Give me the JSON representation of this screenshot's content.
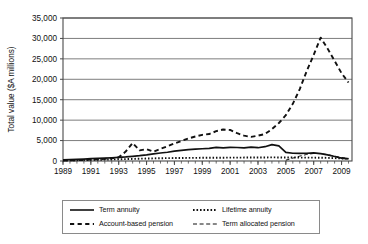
{
  "chart_data": {
    "type": "line",
    "title": "",
    "xlabel": "",
    "ylabel": "Total value ($A millions)",
    "xlim": [
      1989,
      2009.75
    ],
    "ylim": [
      0,
      35000
    ],
    "ytick_labels": [
      "0",
      "5,000",
      "10,000",
      "15,000",
      "20,000",
      "25,000",
      "30,000",
      "35,000"
    ],
    "ytick_values": [
      0,
      5000,
      10000,
      15000,
      20000,
      25000,
      30000,
      35000
    ],
    "xtick_labels": [
      "1989",
      "1991",
      "1993",
      "1995",
      "1997",
      "1999",
      "2001",
      "2003",
      "2005",
      "2007",
      "2009"
    ],
    "xtick_values": [
      1989,
      1991,
      1993,
      1995,
      1997,
      1999,
      2001,
      2003,
      2005,
      2007,
      2009
    ],
    "minor_xtick_interval": 0.5,
    "grid": "horizontal",
    "legend_position": "below",
    "x": [
      1989,
      1989.5,
      1990,
      1990.5,
      1991,
      1991.5,
      1992,
      1992.5,
      1993,
      1993.5,
      1994,
      1994.5,
      1995,
      1995.5,
      1996,
      1996.5,
      1997,
      1997.5,
      1998,
      1998.5,
      1999,
      1999.5,
      2000,
      2000.5,
      2001,
      2001.5,
      2002,
      2002.5,
      2003,
      2003.5,
      2004,
      2004.5,
      2005,
      2005.5,
      2006,
      2006.5,
      2007,
      2007.5,
      2008,
      2008.5,
      2009,
      2009.5
    ],
    "series": [
      {
        "name": "Term annuity",
        "style": "solid",
        "values": [
          300,
          350,
          420,
          480,
          560,
          640,
          720,
          800,
          900,
          1000,
          1150,
          1300,
          1500,
          1750,
          1950,
          2150,
          2400,
          2600,
          2800,
          2900,
          3000,
          3100,
          3350,
          3200,
          3350,
          3300,
          3200,
          3400,
          3250,
          3500,
          4000,
          3700,
          2100,
          1900,
          1850,
          1900,
          2000,
          1800,
          1500,
          1100,
          700,
          500
        ]
      },
      {
        "name": "Account-based pension",
        "style": "dashed",
        "values": [
          120,
          150,
          200,
          260,
          330,
          420,
          520,
          650,
          900,
          2300,
          4400,
          2600,
          2900,
          2300,
          3000,
          3600,
          4300,
          4900,
          5500,
          6000,
          6400,
          6600,
          7300,
          7700,
          7600,
          6800,
          6200,
          5900,
          6200,
          6600,
          7800,
          9300,
          11200,
          14000,
          17600,
          22000,
          26000,
          30200,
          27500,
          24500,
          21500,
          19200
        ]
      },
      {
        "name": "Lifetime annuity",
        "style": "dotted",
        "values": [
          150,
          170,
          200,
          230,
          260,
          300,
          340,
          380,
          420,
          470,
          520,
          560,
          600,
          640,
          680,
          700,
          720,
          740,
          760,
          770,
          780,
          790,
          800,
          810,
          820,
          830,
          840,
          850,
          860,
          870,
          880,
          870,
          860,
          850,
          840,
          830,
          820,
          800,
          760,
          700,
          620,
          560
        ]
      },
      {
        "name": "Term allocated pension",
        "style": "fine-dashed",
        "values": [
          0,
          0,
          0,
          0,
          0,
          0,
          0,
          0,
          0,
          0,
          0,
          0,
          0,
          0,
          0,
          0,
          0,
          0,
          0,
          0,
          0,
          0,
          0,
          0,
          0,
          0,
          0,
          0,
          0,
          0,
          0,
          0,
          200,
          700,
          1200,
          1600,
          1850,
          1800,
          1550,
          1200,
          850,
          650
        ]
      }
    ]
  },
  "legend": {
    "entries": [
      {
        "label": "Term annuity",
        "style": "solid"
      },
      {
        "label": "Lifetime annuity",
        "style": "dotted"
      },
      {
        "label": "Account-based pension",
        "style": "dashed"
      },
      {
        "label": "Term allocated pension",
        "style": "fine-dashed"
      }
    ]
  },
  "colors": {
    "line": "#111111",
    "grid": "#7d7d7d",
    "axis": "#4a4a4a",
    "text": "#111111",
    "background": "#ffffff"
  }
}
